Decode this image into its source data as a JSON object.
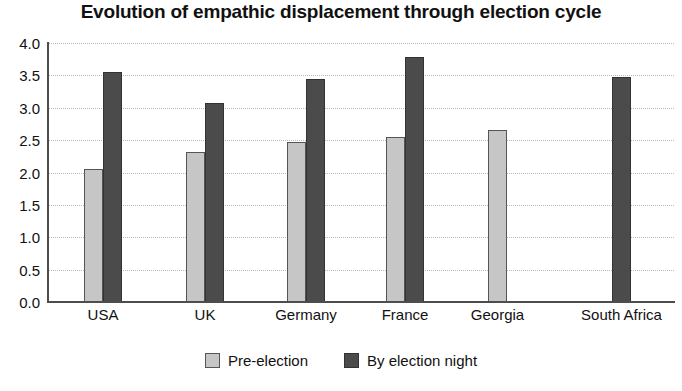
{
  "chart_data": {
    "type": "bar",
    "title": "Evolution of empathic displacement through election cycle",
    "xlabel": "",
    "ylabel": "",
    "ylim": [
      0.0,
      4.0
    ],
    "yticks": [
      "0.0",
      "0.5",
      "1.0",
      "1.5",
      "2.0",
      "2.5",
      "3.0",
      "3.5",
      "4.0"
    ],
    "ytick_values": [
      0.0,
      0.5,
      1.0,
      1.5,
      2.0,
      2.5,
      3.0,
      3.5,
      4.0
    ],
    "grid": true,
    "grid_style": "dotted-horizontal",
    "legend_position": "bottom-center",
    "categories": [
      "USA",
      "UK",
      "Germany",
      "France",
      "Georgia",
      "South Africa"
    ],
    "series": [
      {
        "name": "Pre-election",
        "color": "#c6c6c6",
        "values": [
          2.05,
          2.32,
          2.47,
          2.55,
          2.66,
          null
        ]
      },
      {
        "name": "By election night",
        "color": "#4b4b4b",
        "values": [
          3.55,
          3.07,
          3.45,
          3.78,
          null,
          3.48
        ]
      }
    ]
  },
  "legend": {
    "items": [
      {
        "label": "Pre-election",
        "swatch": "pre"
      },
      {
        "label": "By election night",
        "swatch": "night"
      }
    ]
  }
}
